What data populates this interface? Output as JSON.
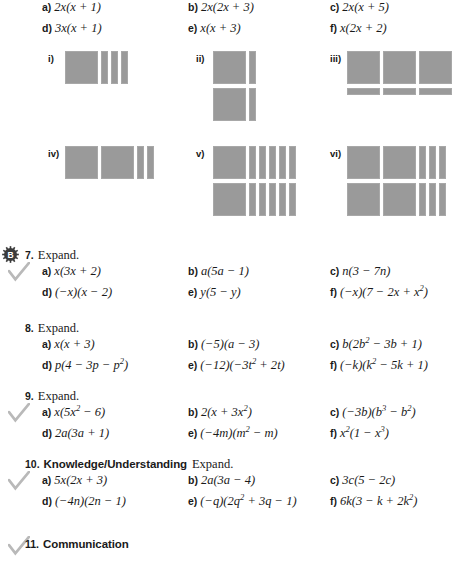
{
  "page": {
    "background": "#ffffff",
    "tile_color": "#9a9a9a",
    "check_color": "#b9b9b9",
    "badge_color": "#3b3b3b"
  },
  "choices": {
    "rows": [
      [
        {
          "letter": "a)",
          "expr_html": "2<i>x</i>(<i>x</i> + 1)"
        },
        {
          "letter": "b)",
          "expr_html": "2<i>x</i>(2<i>x</i> + 3)"
        },
        {
          "letter": "c)",
          "expr_html": "2<i>x</i>(<i>x</i> + 5)"
        }
      ],
      [
        {
          "letter": "d)",
          "expr_html": "3<i>x</i>(<i>x</i> + 1)"
        },
        {
          "letter": "e)",
          "expr_html": "<i>x</i>(<i>x</i> + 3)"
        },
        {
          "letter": "f)",
          "expr_html": "<i>x</i>(2<i>x</i> + 2)"
        }
      ]
    ]
  },
  "tile_groups": [
    {
      "label": "i)",
      "left": 48,
      "top": 4,
      "rows": [
        [
          "sq",
          "vbar",
          "vbar",
          "vbar"
        ]
      ]
    },
    {
      "label": "ii)",
      "left": 196,
      "top": 4,
      "rows": [
        [
          "sq",
          "vbar"
        ],
        [
          "sq",
          "vbar"
        ]
      ]
    },
    {
      "label": "iii)",
      "left": 330,
      "top": 4,
      "rows": [
        [
          "sq",
          "sq",
          "sq"
        ],
        [
          "hbar",
          "hbar",
          "hbar"
        ]
      ]
    },
    {
      "label": "iv)",
      "left": 48,
      "top": 99,
      "rows": [
        [
          "sq",
          "sq",
          "vbar",
          "vbar"
        ]
      ]
    },
    {
      "label": "v)",
      "left": 196,
      "top": 99,
      "rows": [
        [
          "sq",
          "vbar",
          "vbar",
          "vbar",
          "vbar",
          "vbar"
        ],
        [
          "sq",
          "vbar",
          "vbar",
          "vbar",
          "vbar",
          "vbar"
        ]
      ]
    },
    {
      "label": "vi)",
      "left": 330,
      "top": 99,
      "rows": [
        [
          "sq",
          "sq",
          "vbar",
          "vbar",
          "vbar"
        ],
        [
          "sq",
          "sq",
          "vbar",
          "vbar",
          "vbar"
        ]
      ]
    }
  ],
  "questions": [
    {
      "number": "7.",
      "title": "Expand.",
      "strand": "",
      "top": 248,
      "marks": {
        "badge": "B",
        "check": true
      },
      "items": [
        [
          {
            "letter": "a)",
            "expr_html": "<i>x</i>(3<i>x</i> + 2)"
          },
          {
            "letter": "b)",
            "expr_html": "<i>a</i>(5<i>a</i> &#8722; 1)"
          },
          {
            "letter": "c)",
            "expr_html": "<i>n</i>(3 &#8722; 7<i>n</i>)"
          }
        ],
        [
          {
            "letter": "d)",
            "expr_html": "(&#8722;<i>x</i>)(<i>x</i> &#8722; 2)"
          },
          {
            "letter": "e)",
            "expr_html": "<i>y</i>(5 &#8722; <i>y</i>)"
          },
          {
            "letter": "f)",
            "expr_html": "(&#8722;<i>x</i>)(7 &#8722; 2<i>x</i> + <i>x</i><sup>2</sup>)"
          }
        ]
      ]
    },
    {
      "number": "8.",
      "title": "Expand.",
      "strand": "",
      "top": 321,
      "marks": {
        "badge": "",
        "check": false
      },
      "items": [
        [
          {
            "letter": "a)",
            "expr_html": "<i>x</i>(<i>x</i> + 3)"
          },
          {
            "letter": "b)",
            "expr_html": "(&#8722;5)(<i>a</i> &#8722; 3)"
          },
          {
            "letter": "c)",
            "expr_html": "<i>b</i>(2<i>b</i><sup>2</sup> &#8722; 3<i>b</i> + 1)"
          }
        ],
        [
          {
            "letter": "d)",
            "expr_html": "<i>p</i>(4 &#8722; 3<i>p</i> &#8722; <i>p</i><sup>2</sup>)"
          },
          {
            "letter": "e)",
            "expr_html": "(&#8722;12)(&#8722;3<i>t</i><sup>2</sup> + 2<i>t</i>)"
          },
          {
            "letter": "f)",
            "expr_html": "(&#8722;<i>k</i>)(<i>k</i><sup>2</sup> &#8722; 5<i>k</i> + 1)"
          }
        ]
      ]
    },
    {
      "number": "9.",
      "title": "Expand.",
      "strand": "",
      "top": 389,
      "marks": {
        "badge": "",
        "check": true
      },
      "items": [
        [
          {
            "letter": "a)",
            "expr_html": "<i>x</i>(5<i>x</i><sup>2</sup> &#8722; 6)"
          },
          {
            "letter": "b)",
            "expr_html": "2(<i>x</i> + 3<i>x</i><sup>2</sup>)"
          },
          {
            "letter": "c)",
            "expr_html": "(&#8722;3<i>b</i>)(<i>b</i><sup>3</sup> &#8722; <i>b</i><sup>2</sup>)"
          }
        ],
        [
          {
            "letter": "d)",
            "expr_html": "2<i>a</i>(3<i>a</i> + 1)"
          },
          {
            "letter": "e)",
            "expr_html": "(&#8722;4<i>m</i>)(<i>m</i><sup>2</sup> &#8722; <i>m</i>)"
          },
          {
            "letter": "f)",
            "expr_html": "<i>x</i><sup>2</sup>(1 &#8722; <i>x</i><sup>3</sup>)"
          }
        ]
      ]
    },
    {
      "number": "10.",
      "title": "Expand.",
      "strand": "Knowledge/Understanding",
      "top": 457,
      "marks": {
        "badge": "",
        "check": true
      },
      "items": [
        [
          {
            "letter": "a)",
            "expr_html": "5<i>x</i>(2<i>x</i> + 3)"
          },
          {
            "letter": "b)",
            "expr_html": "2<i>a</i>(3<i>a</i> &#8722; 4)"
          },
          {
            "letter": "c)",
            "expr_html": "3<i>c</i>(5 &#8722; 2<i>c</i>)"
          }
        ],
        [
          {
            "letter": "d)",
            "expr_html": "(&#8722;4<i>n</i>)(2<i>n</i> &#8722; 1)"
          },
          {
            "letter": "e)",
            "expr_html": "(&#8722;<i>q</i>)(2<i>q</i><sup>2</sup> + 3<i>q</i> &#8722; 1)"
          },
          {
            "letter": "f)",
            "expr_html": "6<i>k</i>(3 &#8722; <i>k</i> + 2<i>k</i><sup>2</sup>)"
          }
        ]
      ]
    },
    {
      "number": "11.",
      "title": "",
      "strand": "Communication",
      "top": 538,
      "marks": {
        "badge": "",
        "check": true
      },
      "items": []
    }
  ]
}
